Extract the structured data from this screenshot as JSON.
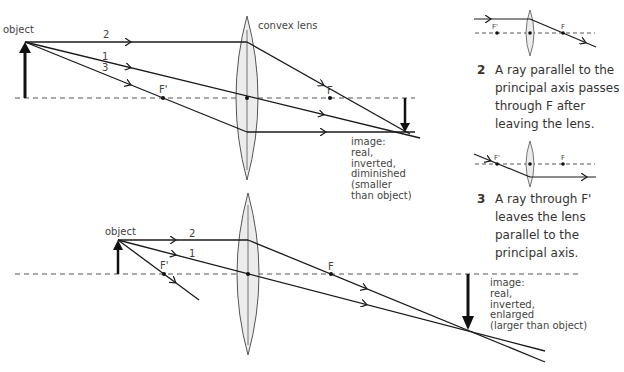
{
  "top_diagram": {
    "object_label": "object",
    "lens_label": "convex lens",
    "ray_labels": [
      "2",
      "1",
      "3"
    ],
    "focal_labels": {
      "near": "F'",
      "far": "F"
    },
    "image_label": [
      "image:",
      "real,",
      "inverted,",
      "diminished",
      "(smaller",
      "than object)"
    ]
  },
  "bottom_diagram": {
    "object_label": "object",
    "ray_labels": [
      "2",
      "1"
    ],
    "focal_labels": {
      "near": "F'",
      "far": "F"
    },
    "image_label": [
      "image:",
      "real,",
      "inverted,",
      "enlarged",
      "(larger than object)"
    ]
  },
  "side_panel": {
    "rule2": {
      "number": "2",
      "text": "A ray parallel to the principal axis passes through F after leaving the lens.",
      "focal_labels": {
        "near": "F'",
        "far": "F"
      }
    },
    "rule3": {
      "number": "3",
      "text": "A ray through F' leaves the lens parallel to the principal axis.",
      "focal_labels": {
        "near": "F'",
        "far": "F"
      }
    }
  },
  "colors": {
    "line": "#1a1a1a",
    "lens_fill": "#ececec",
    "axis": "#555555",
    "text": "#444444"
  }
}
